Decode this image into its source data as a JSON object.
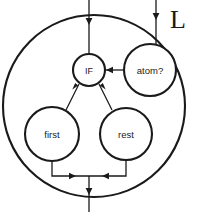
{
  "figure": {
    "title": "L",
    "background_color": "#ffffff",
    "line_color": "#1a1a1a",
    "node_fill": "#ffffff"
  },
  "outer": {
    "name": "outer-boundary-circle",
    "label": "L",
    "cx": 94,
    "cy": 106,
    "r": 91
  },
  "nodes": [
    {
      "id": "if",
      "label": "IF",
      "cx": 89,
      "cy": 70,
      "r": 16
    },
    {
      "id": "atom",
      "label": "atom?",
      "cx": 150,
      "cy": 70,
      "r": 26
    },
    {
      "id": "first",
      "label": "first",
      "cx": 52,
      "cy": 134,
      "r": 27
    },
    {
      "id": "rest",
      "label": "rest",
      "cx": 126,
      "cy": 134,
      "r": 26
    }
  ],
  "edges": [
    {
      "id": "input-top-left",
      "from": "top-boundary",
      "to": "if",
      "kind": "vertical-in",
      "arrow": "down"
    },
    {
      "id": "input-top-right",
      "from": "top-boundary",
      "to": "atom",
      "kind": "vertical-in",
      "arrow": "down"
    },
    {
      "id": "atom-to-if",
      "from": "atom",
      "to": "if",
      "kind": "horizontal",
      "arrow": "left"
    },
    {
      "id": "first-to-if",
      "from": "first",
      "to": "if",
      "kind": "diagonal",
      "arrow": "up-right"
    },
    {
      "id": "rest-to-if",
      "from": "rest",
      "to": "if",
      "kind": "diagonal",
      "arrow": "up-left"
    },
    {
      "id": "first-to-merge",
      "from": "first",
      "to": "merge",
      "kind": "elbow",
      "arrow": "right"
    },
    {
      "id": "rest-to-merge",
      "from": "rest",
      "to": "merge",
      "kind": "elbow",
      "arrow": "left"
    },
    {
      "id": "merge-out-bottom",
      "from": "merge",
      "to": "bottom-boundary",
      "kind": "vertical-out",
      "arrow": "down"
    }
  ],
  "geometry": {
    "top_left_line_x": 89,
    "top_right_line_x": 156,
    "bottom_out_x": 89,
    "merge_y": 176,
    "label_x": 178,
    "label_y": 19
  }
}
